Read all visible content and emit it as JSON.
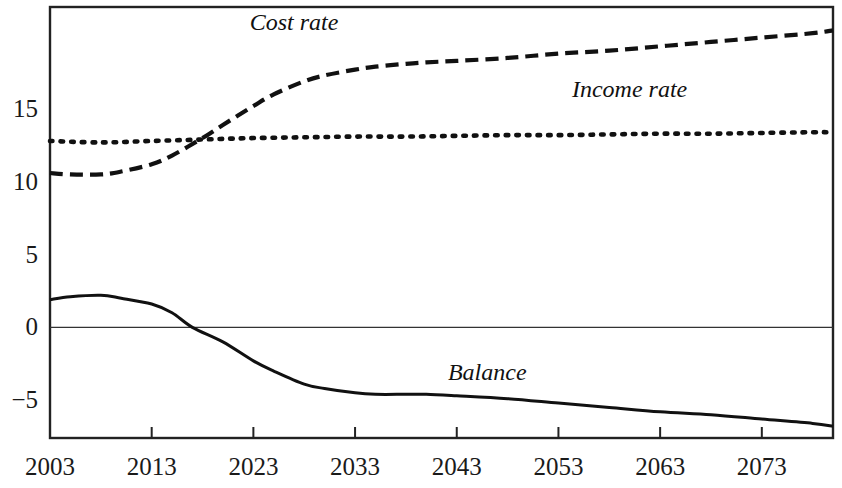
{
  "chart_data": {
    "type": "line",
    "title": "",
    "subtitle": "",
    "xlabel": "",
    "ylabel": "",
    "xlim": [
      2003,
      2080
    ],
    "ylim": [
      -7.6,
      22.0
    ],
    "grid": false,
    "legend_position": "inline-annotations",
    "x_ticks": [
      2003,
      2013,
      2023,
      2033,
      2043,
      2053,
      2063,
      2073
    ],
    "x_tick_labels": [
      "2003",
      "2013",
      "2023",
      "2033",
      "2043",
      "2053",
      "2063",
      "2073"
    ],
    "y_ticks": [
      15,
      10,
      5,
      0,
      -5
    ],
    "y_tick_labels": [
      "15",
      "10",
      "5",
      "0",
      "−5"
    ],
    "zero_line": 0,
    "series": [
      {
        "name": "Cost rate",
        "style": "dashed",
        "color": "#111111",
        "label_x": 2027,
        "label_y": 21.0,
        "x": [
          2003,
          2005,
          2008,
          2010,
          2013,
          2015,
          2018,
          2020,
          2023,
          2025,
          2028,
          2030,
          2033,
          2035,
          2038,
          2040,
          2043,
          2048,
          2053,
          2058,
          2063,
          2068,
          2073,
          2078,
          2080
        ],
        "values": [
          10.6,
          10.5,
          10.5,
          10.7,
          11.2,
          11.8,
          13.0,
          13.9,
          15.2,
          16.0,
          16.9,
          17.3,
          17.7,
          17.9,
          18.1,
          18.2,
          18.3,
          18.5,
          18.8,
          19.0,
          19.3,
          19.6,
          19.9,
          20.2,
          20.4
        ]
      },
      {
        "name": "Income rate",
        "style": "dotted",
        "color": "#111111",
        "label_x": 2060,
        "label_y": 16.4,
        "x": [
          2003,
          2008,
          2013,
          2018,
          2023,
          2028,
          2033,
          2038,
          2043,
          2048,
          2053,
          2058,
          2063,
          2068,
          2073,
          2078,
          2080
        ],
        "values": [
          12.8,
          12.7,
          12.8,
          12.9,
          13.0,
          13.05,
          13.1,
          13.1,
          13.15,
          13.2,
          13.2,
          13.25,
          13.3,
          13.3,
          13.35,
          13.4,
          13.4
        ]
      },
      {
        "name": "Balance",
        "style": "solid",
        "color": "#111111",
        "label_x": 2046,
        "label_y": -3.1,
        "x": [
          2003,
          2005,
          2008,
          2010,
          2013,
          2015,
          2017,
          2020,
          2023,
          2025,
          2028,
          2030,
          2033,
          2035,
          2038,
          2040,
          2043,
          2048,
          2053,
          2058,
          2063,
          2068,
          2073,
          2078,
          2080
        ],
        "values": [
          1.9,
          2.1,
          2.2,
          2.0,
          1.6,
          1.0,
          0.0,
          -1.0,
          -2.3,
          -3.0,
          -3.9,
          -4.2,
          -4.5,
          -4.6,
          -4.6,
          -4.6,
          -4.7,
          -4.9,
          -5.2,
          -5.5,
          -5.8,
          -6.0,
          -6.3,
          -6.6,
          -6.8
        ]
      }
    ]
  },
  "axis": {
    "y_labels": [
      {
        "text": "15",
        "value": 15
      },
      {
        "text": "10",
        "value": 10
      },
      {
        "text": "5",
        "value": 5
      },
      {
        "text": "0",
        "value": 0
      },
      {
        "text": "−5",
        "value": -5
      }
    ],
    "x_labels": [
      {
        "text": "2003",
        "value": 2003
      },
      {
        "text": "2013",
        "value": 2013
      },
      {
        "text": "2023",
        "value": 2023
      },
      {
        "text": "2033",
        "value": 2033
      },
      {
        "text": "2043",
        "value": 2043
      },
      {
        "text": "2053",
        "value": 2053
      },
      {
        "text": "2063",
        "value": 2063
      },
      {
        "text": "2073",
        "value": 2073
      }
    ]
  },
  "annotations": {
    "cost_rate_label": "Cost rate",
    "income_rate_label": "Income rate",
    "balance_label": "Balance"
  },
  "colors": {
    "line": "#111111",
    "frame": "#222222",
    "zero_line": "#333333",
    "background": "#ffffff"
  }
}
